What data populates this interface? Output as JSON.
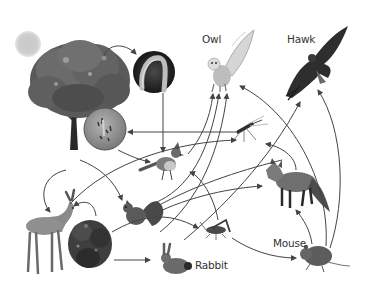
{
  "diagram": {
    "type": "food-web",
    "labels": {
      "owl": "Owl",
      "hawk": "Hawk",
      "rabbit": "Rabbit",
      "mouse": "Mouse"
    },
    "nodes": [
      {
        "id": "sun",
        "labeled": false
      },
      {
        "id": "tree",
        "labeled": false
      },
      {
        "id": "caterpillar",
        "labeled": false
      },
      {
        "id": "fungus",
        "labeled": false
      },
      {
        "id": "mosquito",
        "labeled": false
      },
      {
        "id": "bluejay",
        "labeled": false
      },
      {
        "id": "owl",
        "label": "Owl"
      },
      {
        "id": "hawk",
        "label": "Hawk"
      },
      {
        "id": "deer",
        "labeled": false
      },
      {
        "id": "shrub",
        "labeled": false
      },
      {
        "id": "squirrel",
        "labeled": false
      },
      {
        "id": "grasshopper",
        "labeled": false
      },
      {
        "id": "fox",
        "labeled": false
      },
      {
        "id": "rabbit",
        "label": "Rabbit"
      },
      {
        "id": "mouse",
        "label": "Mouse"
      }
    ],
    "edges": [
      {
        "from": "tree",
        "to": "caterpillar"
      },
      {
        "from": "caterpillar",
        "to": "bluejay"
      },
      {
        "from": "mosquito",
        "to": "fungus"
      },
      {
        "from": "fungus",
        "to": "bluejay"
      },
      {
        "from": "tree",
        "to": "squirrel"
      },
      {
        "from": "tree",
        "to": "deer"
      },
      {
        "from": "shrub",
        "to": "deer"
      },
      {
        "from": "deer",
        "to": "mosquito"
      },
      {
        "from": "bluejay",
        "to": "owl"
      },
      {
        "from": "squirrel",
        "to": "owl"
      },
      {
        "from": "rabbit",
        "to": "owl"
      },
      {
        "from": "squirrel",
        "to": "fox"
      },
      {
        "from": "shrub",
        "to": "grasshopper"
      },
      {
        "from": "shrub",
        "to": "rabbit"
      },
      {
        "from": "grasshopper",
        "to": "bluejay"
      },
      {
        "from": "grasshopper",
        "to": "mouse"
      },
      {
        "from": "mouse",
        "to": "fox"
      },
      {
        "from": "mouse",
        "to": "owl"
      },
      {
        "from": "mouse",
        "to": "hawk"
      },
      {
        "from": "fox",
        "to": "mosquito"
      },
      {
        "from": "rabbit",
        "to": "hawk"
      },
      {
        "from": "squirrel",
        "to": "hawk"
      }
    ],
    "colors": {
      "arrow": "#444444",
      "sun": "#c8c8c8",
      "label": "#333333"
    }
  }
}
